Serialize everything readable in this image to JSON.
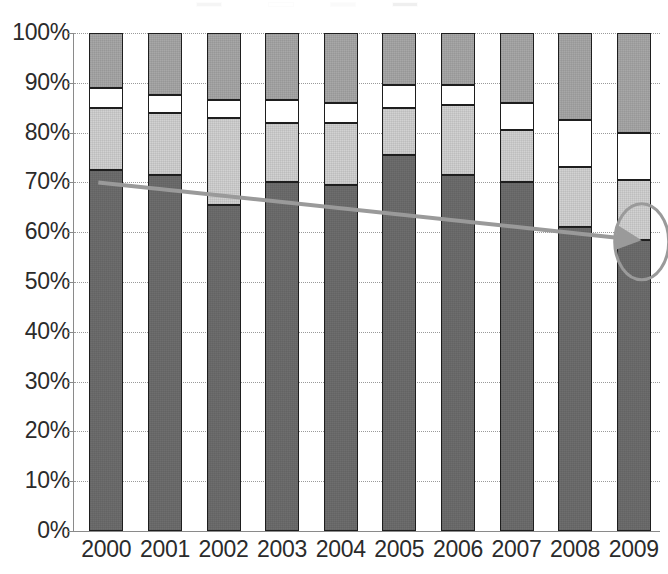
{
  "chart_data": {
    "type": "bar",
    "subtype": "100% stacked column",
    "title": "",
    "subtitle": "",
    "xlabel": "",
    "ylabel": "",
    "categories": [
      "2000",
      "2001",
      "2002",
      "2003",
      "2004",
      "2005",
      "2006",
      "2007",
      "2008",
      "2009"
    ],
    "ylim": [
      0,
      100
    ],
    "ytick_labels": [
      "100%",
      "90%",
      "80%",
      "70%",
      "60%",
      "50%",
      "40%",
      "30%",
      "20%",
      "10%",
      "0%"
    ],
    "ytick_values": [
      100,
      90,
      80,
      70,
      60,
      50,
      40,
      30,
      20,
      10,
      0
    ],
    "grid": true,
    "grid_style": "dotted horizontal",
    "legend_position": "top (cropped)",
    "stack_order_bottom_to_top": [
      "series1",
      "series2",
      "series3",
      "series4"
    ],
    "series": [
      {
        "name": "series1",
        "color": "#6e6e6e",
        "values": [
          72.5,
          71.5,
          65.5,
          70.0,
          69.5,
          75.5,
          71.5,
          70.0,
          61.0,
          58.5
        ]
      },
      {
        "name": "series2",
        "color": "#d2d2d2",
        "values": [
          12.5,
          12.5,
          17.5,
          12.0,
          12.5,
          9.5,
          14.0,
          10.5,
          12.0,
          12.0
        ]
      },
      {
        "name": "series3",
        "color": "#ffffff",
        "values": [
          4.0,
          3.5,
          3.5,
          4.5,
          4.0,
          4.5,
          4.0,
          5.5,
          9.5,
          9.5
        ]
      },
      {
        "name": "series4",
        "color": "#a8a8a8",
        "values": [
          11.0,
          12.5,
          13.5,
          13.5,
          14.0,
          10.5,
          10.5,
          14.0,
          17.5,
          20.0
        ]
      }
    ],
    "annotations": [
      {
        "type": "trendline",
        "label": "",
        "color": "#9a9a9a",
        "from": {
          "x": "2000",
          "y": 70.0
        },
        "to": {
          "x": "2009",
          "y": 58.5
        },
        "style": "straight declining line with arrowhead"
      },
      {
        "type": "ellipse-highlight",
        "label": "",
        "color": "#9a9a9a",
        "target": {
          "x": "2009",
          "y": 58.5
        },
        "style": "open gray oval outline"
      }
    ]
  },
  "legend": {
    "items": [
      {
        "label": "",
        "color": "#a8a8a8"
      },
      {
        "label": "",
        "color": "#ffffff"
      },
      {
        "label": "",
        "color": "#d2d2d2"
      },
      {
        "label": "",
        "color": "#6e6e6e"
      }
    ]
  },
  "colors": {
    "series1": "#6e6e6e",
    "series2": "#d2d2d2",
    "series3": "#ffffff",
    "series4": "#a8a8a8",
    "annotation": "#9a9a9a",
    "axis": "#8a8a8a",
    "grid": "#9a9a9a",
    "text": "#2b2b2b",
    "bar_outline": "#1e1e1e",
    "background": "#ffffff"
  }
}
